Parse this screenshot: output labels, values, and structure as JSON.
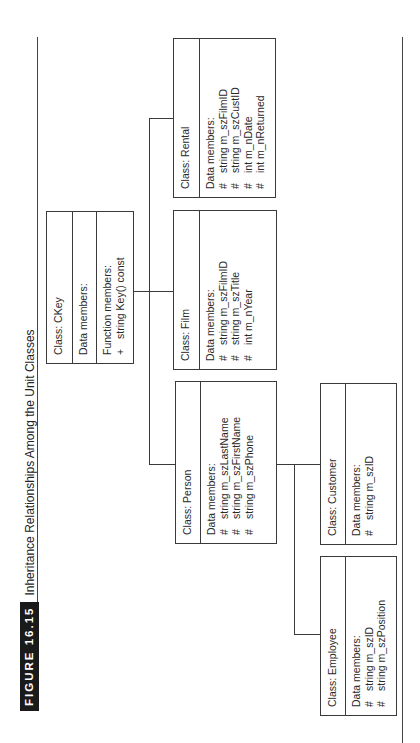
{
  "figure": {
    "label": "FIGURE 16.15",
    "title": "Inheritance Relationships Among the Unit Classes"
  },
  "classes": {
    "ckey": {
      "name": "Class: CKey",
      "data_header": "Data members:",
      "function_header": "Function members:",
      "functions": [
        {
          "symbol": "+",
          "text": "string Key() const"
        }
      ]
    },
    "rental": {
      "name": "Class: Rental",
      "data_header": "Data members:",
      "members": [
        {
          "symbol": "#",
          "text": "string m_szFilmID"
        },
        {
          "symbol": "#",
          "text": "string m_szCustID"
        },
        {
          "symbol": "#",
          "text": "int m_nDate"
        },
        {
          "symbol": "#",
          "text": "int m_nReturned"
        }
      ]
    },
    "film": {
      "name": "Class: Film",
      "data_header": "Data members:",
      "members": [
        {
          "symbol": "#",
          "text": "string m_szFilmID"
        },
        {
          "symbol": "#",
          "text": "string m_szTitle"
        },
        {
          "symbol": "#",
          "text": "int m_nYear"
        }
      ]
    },
    "person": {
      "name": "Class: Person",
      "data_header": "Data members:",
      "members": [
        {
          "symbol": "#",
          "text": "string m_szLastName"
        },
        {
          "symbol": "#",
          "text": "string m_szFirstName"
        },
        {
          "symbol": "#",
          "text": "string m_szPhone"
        }
      ]
    },
    "customer": {
      "name": "Class: Customer",
      "data_header": "Data members:",
      "members": [
        {
          "symbol": "#",
          "text": "string m_szID"
        }
      ]
    },
    "employee": {
      "name": "Class: Employee",
      "data_header": "Data members:",
      "members": [
        {
          "symbol": "#",
          "text": "string m_szID"
        },
        {
          "symbol": "#",
          "text": "string m_szPosition"
        }
      ]
    }
  },
  "colors": {
    "line": "#3a3a3a",
    "figure_label_bg": "#1a1a1a",
    "figure_label_fg": "#ffffff"
  }
}
